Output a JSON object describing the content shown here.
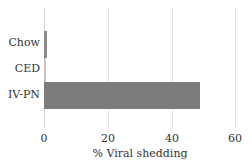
{
  "chart_data": {
    "type": "bar",
    "orientation": "horizontal",
    "title": "",
    "categories": [
      "Chow",
      "CED",
      "IV-PN"
    ],
    "values": [
      1,
      0.5,
      49
    ],
    "colors": [
      "#8a8a8a",
      "#c4c4c4",
      "#7c7c7c"
    ],
    "xlabel": "% Viral shedding",
    "ylabel": "",
    "xlim": [
      0,
      60
    ],
    "xticks": [
      "0",
      "20",
      "40",
      "60"
    ],
    "grid": true,
    "legend": null
  }
}
